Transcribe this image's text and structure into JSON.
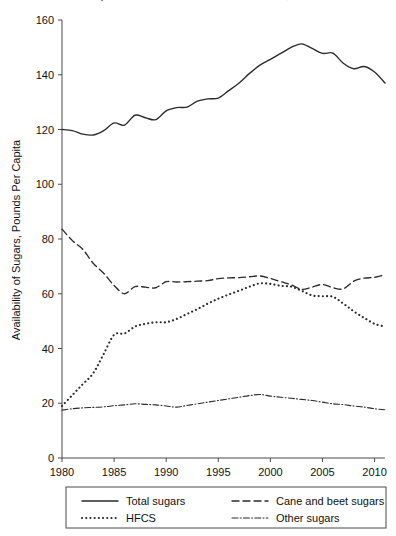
{
  "title_clipped": "Availability of Caloric Sweeteners in the United States, 1980-2011",
  "chart_data": {
    "type": "line",
    "title": "",
    "xlabel": "",
    "ylabel": "Availability of Sugars, Pounds Per Capita",
    "xlim": [
      1980,
      2011
    ],
    "ylim": [
      0,
      160
    ],
    "xticks": [
      1980,
      1985,
      1990,
      1995,
      2000,
      2005,
      2010
    ],
    "yticks": [
      0,
      20,
      40,
      60,
      80,
      100,
      120,
      140,
      160
    ],
    "grid": false,
    "legend_position": "below",
    "x": [
      1980,
      1981,
      1982,
      1983,
      1984,
      1985,
      1986,
      1987,
      1988,
      1989,
      1990,
      1991,
      1992,
      1993,
      1994,
      1995,
      1996,
      1997,
      1998,
      1999,
      2000,
      2001,
      2002,
      2003,
      2004,
      2005,
      2006,
      2007,
      2008,
      2009,
      2010,
      2011
    ],
    "series": [
      {
        "name": "Total sugars",
        "style": "solid",
        "values": [
          120.0,
          119.6,
          118.3,
          118.0,
          119.6,
          122.4,
          121.6,
          125.2,
          124.3,
          123.6,
          126.8,
          128.0,
          128.2,
          130.4,
          131.2,
          131.5,
          134.2,
          137.0,
          140.5,
          143.5,
          145.6,
          147.8,
          150.0,
          151.3,
          149.6,
          147.8,
          147.9,
          144.2,
          142.2,
          143.0,
          141.0,
          137.0
        ]
      },
      {
        "name": "Cane and beet sugars",
        "style": "dashed",
        "values": [
          83.6,
          79.4,
          76.2,
          71.1,
          67.5,
          63.0,
          60.0,
          62.6,
          62.4,
          62.2,
          64.4,
          64.3,
          64.4,
          64.6,
          64.8,
          65.5,
          65.8,
          65.9,
          66.2,
          66.5,
          65.6,
          64.4,
          63.3,
          61.6,
          62.4,
          63.4,
          62.2,
          61.8,
          64.6,
          65.7,
          66.0,
          67.0
        ]
      },
      {
        "name": "HFCS",
        "style": "dotted",
        "values": [
          19.0,
          23.0,
          27.0,
          31.0,
          38.0,
          45.0,
          45.5,
          48.0,
          49.0,
          49.6,
          49.6,
          50.8,
          52.6,
          54.4,
          56.4,
          58.2,
          59.7,
          61.1,
          62.6,
          63.8,
          63.6,
          62.9,
          62.6,
          61.1,
          59.4,
          59.1,
          58.9,
          56.4,
          53.6,
          51.2,
          49.0,
          48.0
        ]
      },
      {
        "name": "Other sugars",
        "style": "dashdot",
        "values": [
          17.5,
          18.0,
          18.3,
          18.5,
          18.7,
          19.1,
          19.4,
          19.8,
          19.6,
          19.4,
          19.0,
          18.6,
          19.2,
          19.8,
          20.4,
          21.0,
          21.6,
          22.2,
          22.8,
          23.2,
          22.6,
          22.2,
          21.8,
          21.4,
          21.0,
          20.4,
          19.8,
          19.5,
          19.0,
          18.6,
          18.0,
          17.6
        ]
      }
    ],
    "legend": [
      {
        "label": "Total sugars",
        "style": "solid"
      },
      {
        "label": "Cane and beet sugars",
        "style": "dashed"
      },
      {
        "label": "HFCS",
        "style": "dotted"
      },
      {
        "label": "Other sugars",
        "style": "dashdot"
      }
    ]
  }
}
